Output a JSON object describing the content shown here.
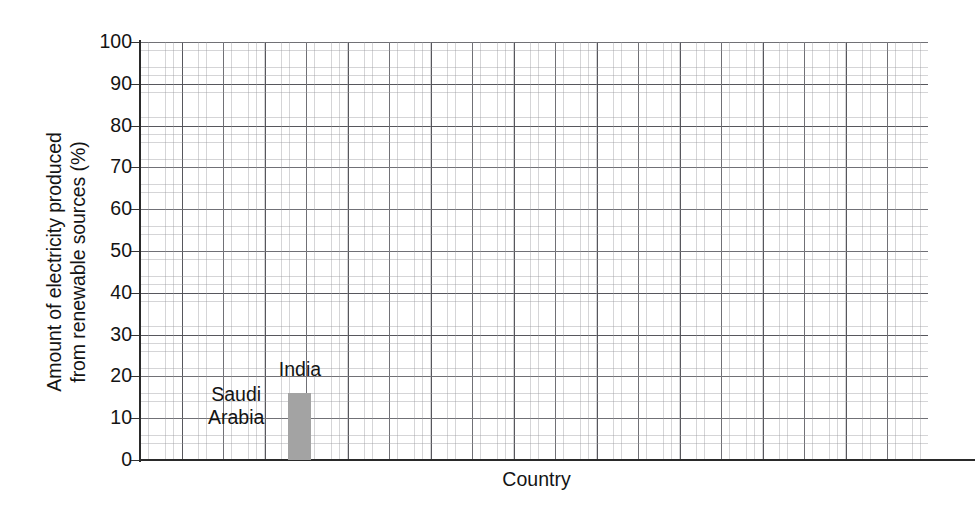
{
  "chart_data": {
    "type": "bar",
    "title": "",
    "subtitle": "",
    "xlabel": "Country",
    "ylabel_line1": "Amount of electricity produced",
    "ylabel_line2": "from renewable sources (%)",
    "ylabel": "Amount of electricity produced from renewable sources (%)",
    "categories": [
      "Saudi Arabia",
      "India"
    ],
    "values": [
      0,
      16
    ],
    "value_unit": "%",
    "ylim": [
      0,
      100
    ],
    "yticks": [
      0,
      10,
      20,
      30,
      40,
      50,
      60,
      70,
      80,
      90,
      100
    ],
    "ytick_labels": [
      "0",
      "10",
      "20",
      "30",
      "40",
      "50",
      "60",
      "70",
      "80",
      "90",
      "100"
    ],
    "xticks": [],
    "xtick_labels": [],
    "grid": "graph-paper-major-and-minor",
    "grid_major_step_y": 10,
    "grid_minor_per_major": 5,
    "legend": "none",
    "bar_color": "#a3a3a3",
    "grid_major_color": "#4e4e54",
    "grid_minor_color": "#96969b",
    "axis_color": "#2a2a2a",
    "text_color": "#141414",
    "background": "#ffffff",
    "bars": [
      {
        "category": "Saudi Arabia",
        "value": 0,
        "label_lines": [
          "Saudi",
          "Arabia"
        ],
        "label_center_x_pct": 12.2,
        "label_top_pct": 81.5,
        "has_visible_bar": false,
        "bar_left_pct": 9.0,
        "bar_width_pct": 2.9
      },
      {
        "category": "India",
        "value": 16,
        "label_lines": [
          "India"
        ],
        "label_center_x_pct": 20.3,
        "label_top_pct": 75.6,
        "has_visible_bar": true,
        "bar_left_pct": 18.8,
        "bar_width_pct": 2.9
      }
    ]
  },
  "axes": {
    "y_title_line1": "Amount of electricity produced",
    "y_title_line2": "from renewable sources (%)",
    "x_title": "Country"
  }
}
